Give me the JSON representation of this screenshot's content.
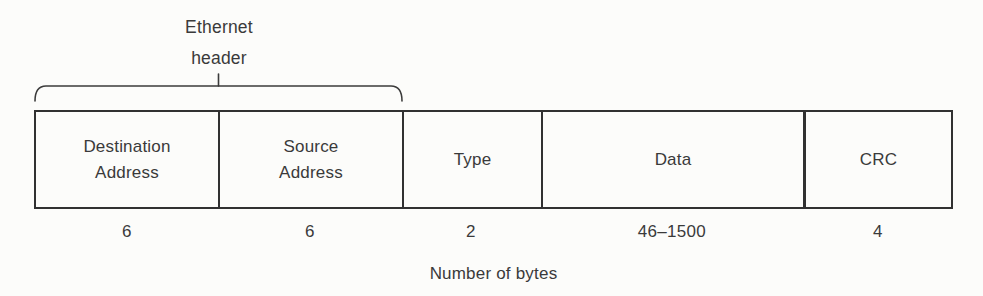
{
  "figure": {
    "header_brace": {
      "label_line1": "Ethernet",
      "label_line2": "header"
    },
    "fields": [
      {
        "id": "destination-address",
        "label_line1": "Destination",
        "label_line2": "Address",
        "bytes": "6"
      },
      {
        "id": "source-address",
        "label_line1": "Source",
        "label_line2": "Address",
        "bytes": "6"
      },
      {
        "id": "type",
        "label_line1": "Type",
        "label_line2": "",
        "bytes": "2"
      },
      {
        "id": "data",
        "label_line1": "Data",
        "label_line2": "",
        "bytes": "46–1500"
      },
      {
        "id": "crc",
        "label_line1": "CRC",
        "label_line2": "",
        "bytes": "4"
      }
    ],
    "caption": "Number of bytes",
    "colors": {
      "line": "#313131",
      "text": "#3a3a3a",
      "background": "#fcfcfa"
    }
  }
}
